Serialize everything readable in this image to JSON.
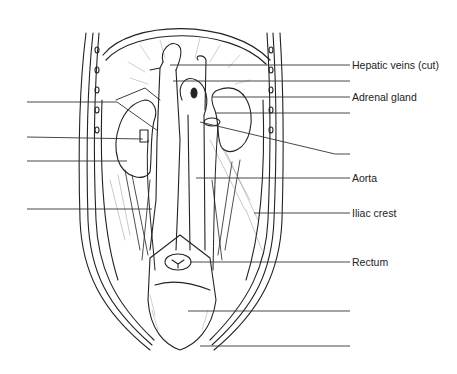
{
  "diagram": {
    "labels": [
      {
        "id": "hepatic-veins",
        "text": "Hepatic veins (cut)",
        "x": 352,
        "y": 59
      },
      {
        "id": "adrenal-gland",
        "text": "Adrenal gland",
        "x": 352,
        "y": 91
      },
      {
        "id": "aorta",
        "text": "Aorta",
        "x": 352,
        "y": 172
      },
      {
        "id": "iliac-crest",
        "text": "Iliac crest",
        "x": 352,
        "y": 207
      },
      {
        "id": "rectum",
        "text": "Rectum",
        "x": 352,
        "y": 256
      }
    ],
    "leaders_right": [
      {
        "x1": 170,
        "y1": 65,
        "x2": 350,
        "y2": 65,
        "labeled": true
      },
      {
        "x1": 173,
        "y1": 81,
        "x2": 350,
        "y2": 81,
        "labeled": false
      },
      {
        "x1": 213,
        "y1": 97,
        "x2": 350,
        "y2": 97,
        "labeled": true
      },
      {
        "x1": 215,
        "y1": 113,
        "x2": 350,
        "y2": 113,
        "labeled": false
      },
      {
        "x1": 200,
        "y1": 122,
        "x2": 335,
        "y2": 154,
        "x3": 350,
        "y3": 154,
        "labeled": false
      },
      {
        "x1": 196,
        "y1": 178,
        "x2": 350,
        "y2": 178,
        "labeled": true
      },
      {
        "x1": 254,
        "y1": 213,
        "x2": 350,
        "y2": 213,
        "labeled": true
      },
      {
        "x1": 190,
        "y1": 262,
        "x2": 350,
        "y2": 262,
        "labeled": true
      },
      {
        "x1": 188,
        "y1": 311,
        "x2": 350,
        "y2": 311,
        "labeled": false
      },
      {
        "x1": 200,
        "y1": 346,
        "x2": 350,
        "y2": 346,
        "labeled": false
      }
    ],
    "leaders_left": [
      {
        "x1": 27,
        "y1": 102,
        "x2": 117,
        "y2": 102,
        "x3": 158,
        "y3": 131
      },
      {
        "x1": 27,
        "y1": 137,
        "x2": 143,
        "y2": 139
      },
      {
        "x1": 27,
        "y1": 161,
        "x2": 127,
        "y2": 161
      },
      {
        "x1": 27,
        "y1": 209,
        "x2": 152,
        "y2": 209
      }
    ]
  }
}
